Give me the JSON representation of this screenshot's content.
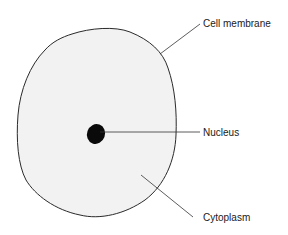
{
  "diagram": {
    "title": "",
    "labels": {
      "cell_membrane": "Cell membrane",
      "nucleus": "Nucleus",
      "cytoplasm": "Cytoplasm"
    },
    "colors": {
      "cytoplasm_fill": "#f2f2f2",
      "outline": "#2a2a2a",
      "nucleus_fill": "#0a0a0a",
      "leader_line": "#333333"
    }
  }
}
